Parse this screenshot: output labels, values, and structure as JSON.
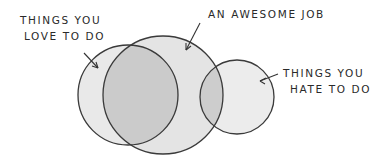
{
  "diagram": {
    "type": "venn",
    "sets": [
      {
        "id": "love",
        "label_line1": "THINGS YOU",
        "label_line2": "LOVE TO DO"
      },
      {
        "id": "job",
        "label": "AN AWESOME JOB"
      },
      {
        "id": "hate",
        "label_line1": "THINGS YOU",
        "label_line2": "HATE TO DO"
      }
    ],
    "colors": {
      "stroke": "#3a3a3a",
      "fill_single": "#e8e8e8",
      "fill_overlap": "#c8c8c8",
      "text": "#2a2a2a"
    }
  }
}
